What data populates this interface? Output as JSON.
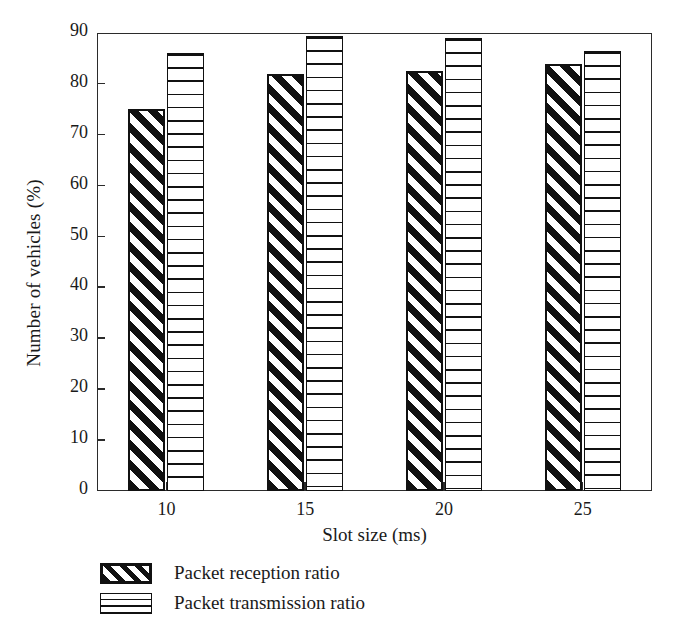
{
  "chart_data": {
    "type": "bar",
    "title": "",
    "xlabel": "Slot size (ms)",
    "ylabel": "Number of vehicles (%)",
    "categories": [
      "10",
      "15",
      "20",
      "25"
    ],
    "series": [
      {
        "name": "Packet reception ratio",
        "values": [
          75,
          82,
          82.5,
          84
        ],
        "pattern": "diagonal-hatch"
      },
      {
        "name": "Packet transmission ratio",
        "values": [
          86,
          89.5,
          89,
          86.5
        ],
        "pattern": "horizontal-lines"
      }
    ],
    "ylim": [
      0,
      90
    ],
    "yticks": [
      0,
      10,
      20,
      30,
      40,
      50,
      60,
      70,
      80,
      90
    ],
    "grid": false,
    "legend_position": "below-axes-left",
    "colors": {
      "line": "#111111",
      "background": "#ffffff"
    }
  },
  "axes": {
    "y_title": "Number of vehicles (%)",
    "x_title": "Slot size (ms)",
    "y_tick_labels": [
      "90",
      "80",
      "70",
      "60",
      "50",
      "40",
      "30",
      "20",
      "10",
      "0"
    ],
    "x_tick_labels": [
      "10",
      "15",
      "20",
      "25"
    ]
  },
  "legend": {
    "items": [
      {
        "label": "Packet reception ratio"
      },
      {
        "label": "Packet transmission ratio"
      }
    ]
  }
}
